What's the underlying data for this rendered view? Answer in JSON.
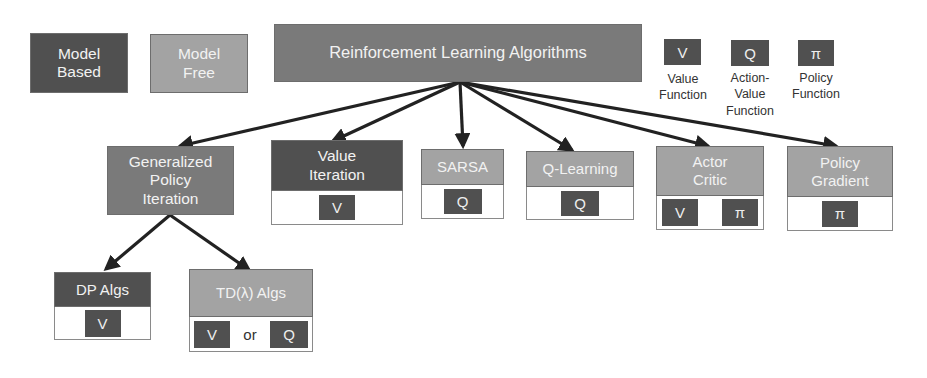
{
  "legend": {
    "model_based": "Model Based",
    "model_free": "Model Free",
    "symbols": [
      {
        "glyph": "V",
        "label_line1": "Value",
        "label_line2": "Function",
        "label_line3": ""
      },
      {
        "glyph": "Q",
        "label_line1": "Action-",
        "label_line2": "Value",
        "label_line3": "Function"
      },
      {
        "glyph": "π",
        "label_line1": "Policy",
        "label_line2": "Function",
        "label_line3": ""
      }
    ]
  },
  "root": {
    "title": "Reinforcement Learning Algorithms"
  },
  "children": [
    {
      "line1": "Generalized",
      "line2": "Policy",
      "line3": "Iteration",
      "type": "model-based-and-free"
    },
    {
      "line1": "Value",
      "line2": "Iteration",
      "type": "model-based",
      "chips": [
        "V"
      ]
    },
    {
      "line1": "SARSA",
      "type": "model-free",
      "chips": [
        "Q"
      ]
    },
    {
      "line1": "Q-Learning",
      "type": "model-free",
      "chips": [
        "Q"
      ]
    },
    {
      "line1": "Actor",
      "line2": "Critic",
      "type": "model-free",
      "chips": [
        "V",
        "π"
      ]
    },
    {
      "line1": "Policy",
      "line2": "Gradient",
      "type": "model-free",
      "chips": [
        "π"
      ]
    }
  ],
  "grandchildren": [
    {
      "title": "DP Algs",
      "type": "model-based",
      "chips": [
        "V"
      ]
    },
    {
      "title": "TD(λ) Algs",
      "type": "model-free",
      "chips": [
        "V",
        "Q"
      ],
      "connector": "or"
    }
  ],
  "colors": {
    "model_based": "#505050",
    "model_free": "#a3a3a3",
    "root": "#7a7a7a",
    "arrow": "#222222"
  }
}
